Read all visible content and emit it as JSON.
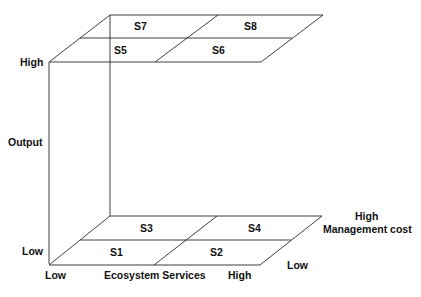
{
  "diagram": {
    "type": "3d-box-with-two-planes",
    "stroke_color": "#2a2a2a",
    "text_color": "#111111",
    "top_plane": {
      "cells": [
        {
          "id": "S5",
          "label": "S5"
        },
        {
          "id": "S6",
          "label": "S6"
        },
        {
          "id": "S7",
          "label": "S7"
        },
        {
          "id": "S8",
          "label": "S8"
        }
      ]
    },
    "bottom_plane": {
      "cells": [
        {
          "id": "S1",
          "label": "S1"
        },
        {
          "id": "S2",
          "label": "S2"
        },
        {
          "id": "S3",
          "label": "S3"
        },
        {
          "id": "S4",
          "label": "S4"
        }
      ]
    },
    "axes": {
      "output": {
        "title": "Output",
        "high": "High",
        "low": "Low"
      },
      "ecosystem_services": {
        "title": "Ecosystem Services",
        "low": "Low",
        "high": "High"
      },
      "management_cost": {
        "title": "Management cost",
        "high": "High",
        "low": "Low"
      }
    }
  }
}
